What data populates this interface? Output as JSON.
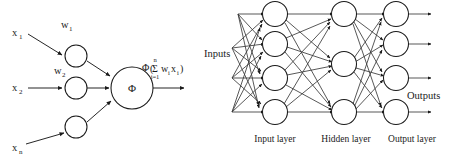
{
  "figure": {
    "background_color": "#ffffff",
    "ink_color": "#1a1a1a",
    "left_panel": {
      "name": "artificial-neuron-model",
      "inputs": [
        {
          "label": "x",
          "subscript": "1"
        },
        {
          "label": "x",
          "subscript": "2"
        },
        {
          "label": "x",
          "subscript": "n"
        }
      ],
      "weights": [
        {
          "label": "w",
          "subscript": "1"
        },
        {
          "label": "w",
          "subscript": "2"
        }
      ],
      "summation_node_label": "Φ",
      "output_formula": {
        "function": "Φ",
        "open_paren": "(",
        "sigma": "Σ",
        "upper_limit": "n",
        "lower_limit": "i=1",
        "term_w": "w",
        "term_w_sub": "i",
        "term_x": "x",
        "term_x_sub": "i",
        "close_paren": ")",
        "plain": "Φ(Σ i=1..n wᵢxᵢ)"
      }
    },
    "right_panel": {
      "name": "feedforward-neural-network",
      "inputs_label": "Inputs",
      "outputs_label": "Outputs",
      "layer_labels": [
        "Input layer",
        "Hidden layer",
        "Output layer"
      ],
      "layer_node_counts": {
        "input": 4,
        "hidden": 3,
        "output": 4
      }
    }
  }
}
